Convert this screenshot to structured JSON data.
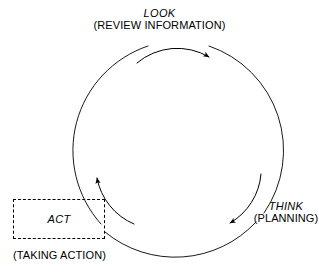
{
  "diagram": {
    "type": "cycle",
    "title": "",
    "background_color": "#ffffff",
    "stroke_color": "#000000",
    "stages": [
      {
        "id": "look",
        "label": "LOOK",
        "sublabel": "(REVIEW INFORMATION)",
        "position": "top",
        "shape": "none"
      },
      {
        "id": "think",
        "label": "THINK",
        "sublabel": "(PLANNING)",
        "position": "bottom-right",
        "shape": "none"
      },
      {
        "id": "act",
        "label": "ACT",
        "sublabel": "(TAKING ACTION)",
        "position": "bottom-left",
        "shape": "dashed-rectangle"
      }
    ],
    "flow_arrows": [
      {
        "id": "look-to-think",
        "from": "look",
        "to": "think",
        "direction": "clockwise"
      },
      {
        "id": "think-to-act",
        "from": "think",
        "to": "act",
        "direction": "clockwise"
      },
      {
        "id": "act-to-look",
        "from": "act",
        "to": "look",
        "direction": "clockwise"
      }
    ]
  }
}
